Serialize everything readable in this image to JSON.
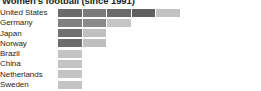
{
  "chart_data": {
    "type": "bar",
    "title": "Women's football (since 1991)",
    "subtitle": "",
    "xlabel": "",
    "ylabel": "",
    "orientation": "horizontal",
    "stacked": true,
    "grid": false,
    "legend": "none",
    "xlim": [
      0,
      8
    ],
    "unit_px": 23.5,
    "categories": [
      "United States",
      "Germany",
      "Japan",
      "Norway",
      "Brazil",
      "China",
      "Netherlands",
      "Sweden"
    ],
    "values": [
      5,
      3,
      2,
      2,
      1,
      1,
      1,
      1
    ],
    "series": [
      {
        "name": "dark-segments",
        "color": "#6e6e6e",
        "values": [
          4,
          2,
          1,
          1,
          0,
          0,
          0,
          0
        ]
      },
      {
        "name": "light-segments",
        "color": "#bdbdbd",
        "values": [
          1,
          1,
          1,
          1,
          1,
          1,
          1,
          1
        ]
      }
    ],
    "rows": [
      {
        "label": "United States",
        "total": 5,
        "segments": [
          {
            "units": 1,
            "color": "#6b6b6b"
          },
          {
            "units": 1,
            "color": "#7a7a7a"
          },
          {
            "units": 1,
            "color": "#6a6a6a"
          },
          {
            "units": 1,
            "color": "#5f5f5f"
          },
          {
            "units": 1,
            "color": "#c2c2c2"
          }
        ]
      },
      {
        "label": "Germany",
        "total": 3,
        "segments": [
          {
            "units": 1,
            "color": "#808080"
          },
          {
            "units": 1,
            "color": "#8a8a8a"
          },
          {
            "units": 1,
            "color": "#c6c6c6"
          }
        ]
      },
      {
        "label": "Japan",
        "total": 2,
        "segments": [
          {
            "units": 1,
            "color": "#717171"
          },
          {
            "units": 1,
            "color": "#c0c0c0"
          }
        ]
      },
      {
        "label": "Norway",
        "total": 2,
        "segments": [
          {
            "units": 1,
            "color": "#6d6d6d"
          },
          {
            "units": 1,
            "color": "#bfbfbf"
          }
        ]
      },
      {
        "label": "Brazil",
        "total": 1,
        "segments": [
          {
            "units": 1,
            "color": "#c4c4c4"
          }
        ]
      },
      {
        "label": "China",
        "total": 1,
        "segments": [
          {
            "units": 1,
            "color": "#c4c4c4"
          }
        ]
      },
      {
        "label": "Netherlands",
        "total": 1,
        "segments": [
          {
            "units": 1,
            "color": "#c4c4c4"
          }
        ]
      },
      {
        "label": "Sweden",
        "total": 1,
        "segments": [
          {
            "units": 1,
            "color": "#c4c4c4"
          }
        ]
      }
    ]
  },
  "colors": {
    "background": "#ffffff",
    "text": "#231f20",
    "bar_dark": "#6e6e6e",
    "bar_light": "#c4c4c4"
  }
}
